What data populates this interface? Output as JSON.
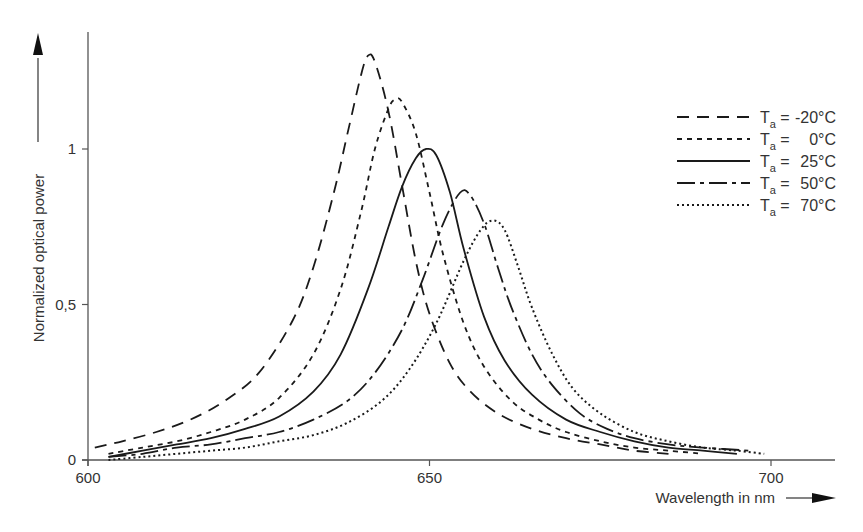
{
  "chart_data": {
    "type": "line",
    "title": "",
    "xlabel": "Wavelength in nm",
    "ylabel": "Normalized optical power",
    "xlim": [
      600,
      710
    ],
    "ylim": [
      0,
      1.35
    ],
    "xticks": [
      600,
      650,
      700
    ],
    "xtick_labels": [
      "600",
      "650",
      "700"
    ],
    "yticks": [
      0,
      0.5,
      1
    ],
    "ytick_labels": [
      "0",
      "0,5",
      "1"
    ],
    "grid": false,
    "legend_position": "upper right",
    "series": [
      {
        "name": "Ta = -20°C",
        "temp_label": "-20°C",
        "dash": "12,8",
        "x": [
          601,
          605,
          610,
          615,
          620,
          625,
          630,
          633,
          636,
          638,
          640,
          641,
          642,
          644,
          646,
          648,
          650,
          653,
          656,
          660,
          665,
          670,
          675,
          680,
          685
        ],
        "y": [
          0.04,
          0.06,
          0.09,
          0.13,
          0.19,
          0.28,
          0.45,
          0.62,
          0.86,
          1.05,
          1.24,
          1.3,
          1.28,
          1.12,
          0.88,
          0.64,
          0.47,
          0.31,
          0.22,
          0.15,
          0.1,
          0.07,
          0.05,
          0.03,
          0.02
        ]
      },
      {
        "name": "Ta = 0°C",
        "temp_label": "0°C",
        "dash": "5,5",
        "x": [
          603,
          608,
          613,
          618,
          623,
          628,
          633,
          637,
          640,
          642,
          644,
          645,
          646,
          648,
          650,
          652,
          655,
          658,
          662,
          666,
          670,
          675,
          680,
          685,
          690
        ],
        "y": [
          0.02,
          0.04,
          0.06,
          0.09,
          0.13,
          0.2,
          0.34,
          0.55,
          0.8,
          1.0,
          1.13,
          1.16,
          1.15,
          1.05,
          0.86,
          0.66,
          0.44,
          0.3,
          0.19,
          0.13,
          0.09,
          0.06,
          0.04,
          0.03,
          0.02
        ]
      },
      {
        "name": "Ta = 25°C",
        "temp_label": "25°C",
        "dash": "",
        "x": [
          603,
          608,
          613,
          618,
          623,
          628,
          633,
          637,
          641,
          644,
          646,
          648,
          649.5,
          651,
          653,
          655,
          658,
          661,
          665,
          670,
          675,
          680,
          685,
          690,
          695
        ],
        "y": [
          0.01,
          0.03,
          0.05,
          0.07,
          0.1,
          0.14,
          0.22,
          0.34,
          0.55,
          0.75,
          0.88,
          0.97,
          1.0,
          0.98,
          0.86,
          0.68,
          0.46,
          0.32,
          0.21,
          0.13,
          0.09,
          0.06,
          0.04,
          0.03,
          0.02
        ]
      },
      {
        "name": "Ta = 50°C",
        "temp_label": "50°C",
        "dash": "18,5,4,5",
        "x": [
          603,
          608,
          613,
          618,
          623,
          628,
          633,
          638,
          642,
          646,
          649,
          652,
          654.5,
          656,
          658,
          660,
          662,
          665,
          668,
          672,
          676,
          680,
          685,
          690,
          697
        ],
        "y": [
          0.01,
          0.02,
          0.04,
          0.05,
          0.07,
          0.09,
          0.13,
          0.19,
          0.28,
          0.42,
          0.58,
          0.76,
          0.86,
          0.85,
          0.76,
          0.62,
          0.49,
          0.34,
          0.24,
          0.15,
          0.1,
          0.07,
          0.05,
          0.04,
          0.03
        ]
      },
      {
        "name": "Ta = 70°C",
        "temp_label": "70°C",
        "dash": "2,3",
        "x": [
          603,
          608,
          613,
          618,
          623,
          628,
          633,
          638,
          643,
          647,
          651,
          655,
          657.5,
          659.3,
          661,
          663,
          665,
          668,
          671,
          675,
          680,
          685,
          690,
          695,
          699
        ],
        "y": [
          0.0,
          0.01,
          0.02,
          0.03,
          0.04,
          0.06,
          0.08,
          0.12,
          0.19,
          0.29,
          0.44,
          0.64,
          0.74,
          0.77,
          0.74,
          0.62,
          0.49,
          0.34,
          0.23,
          0.15,
          0.09,
          0.06,
          0.04,
          0.03,
          0.02
        ]
      }
    ]
  },
  "legend": {
    "prefix": "T",
    "subscript": "a",
    "equals": "="
  },
  "axis": {
    "x_title": "Wavelength in nm",
    "y_title": "Normalized optical power"
  }
}
